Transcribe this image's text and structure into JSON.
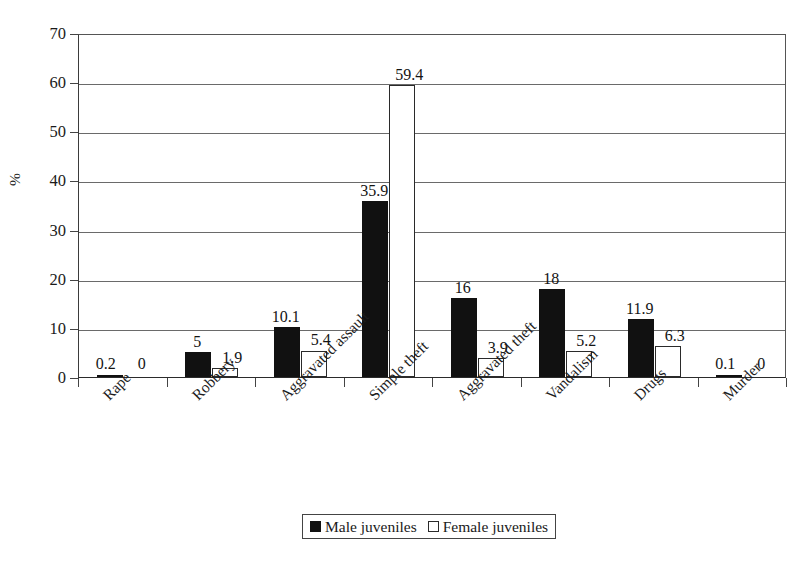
{
  "chart_data": {
    "type": "bar",
    "title": "",
    "xlabel": "",
    "ylabel": "%",
    "ylim": [
      0,
      70
    ],
    "y_ticks": [
      0,
      10,
      20,
      30,
      40,
      50,
      60,
      70
    ],
    "grid": "horizontal",
    "legend_position": "bottom",
    "categories": [
      "Rape",
      "Robbery",
      "Aggravated assault",
      "Simple theft",
      "Aggravated theft",
      "Vandalism",
      "Drugs",
      "Murder"
    ],
    "series": [
      {
        "name": "Male juveniles",
        "color": "#111111",
        "style": "filled",
        "values": [
          0.2,
          5,
          10.1,
          35.9,
          16,
          18,
          11.9,
          0.1
        ],
        "labels": [
          "0.2",
          "5",
          "10.1",
          "35.9",
          "16",
          "18",
          "11.9",
          "0.1"
        ]
      },
      {
        "name": "Female juveniles",
        "color": "#ffffff",
        "style": "hollow",
        "values": [
          0,
          1.9,
          5.4,
          59.4,
          3.9,
          5.2,
          6.3,
          0
        ],
        "labels": [
          "0",
          "1.9",
          "5.4",
          "59.4",
          "3.9",
          "5.2",
          "6.3",
          "0"
        ]
      }
    ]
  },
  "axis": {
    "y_tick_labels": [
      "70",
      "60",
      "50",
      "40",
      "30",
      "20",
      "10",
      "0"
    ],
    "y_axis_title": "%"
  },
  "legend": {
    "items": [
      {
        "label": "Male juveniles",
        "swatch": "filled-square-icon"
      },
      {
        "label": "Female juveniles",
        "swatch": "hollow-square-icon"
      }
    ]
  }
}
